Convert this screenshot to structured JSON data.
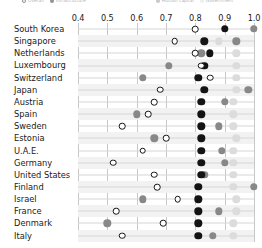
{
  "chart_data": {
    "type": "scatter",
    "title": "",
    "subtitle": "",
    "xlabel": "",
    "ylabel": "",
    "xlim": [
      0.4,
      1.0
    ],
    "xticks": [
      0.4,
      0.5,
      0.6,
      0.7,
      0.8,
      0.9,
      1.0
    ],
    "xtick_labels": [
      "0.4",
      "0.5",
      "0.6",
      "0.7",
      "0.8",
      "0.9",
      "1.0"
    ],
    "grid": true,
    "grid_axis": "x",
    "legend_position": "top",
    "orientation": "horizontal",
    "categories": [
      "South Korea",
      "Singapore",
      "Netherlands",
      "Luxembourg",
      "Switzerland",
      "Japan",
      "Austria",
      "Spain",
      "Sweden",
      "Estonia",
      "U.A.E.",
      "Germany",
      "United States",
      "Finland",
      "Israel",
      "France",
      "Denmark",
      "Italy"
    ],
    "series": [
      {
        "name": "Overall",
        "marker": "open-circle",
        "color": "#141414",
        "fill": "#ffffff",
        "values": [
          0.8,
          0.73,
          0.8,
          0.82,
          0.85,
          0.68,
          0.66,
          0.64,
          0.55,
          0.7,
          0.62,
          0.52,
          0.66,
          0.67,
          0.74,
          0.53,
          0.69,
          0.55
        ]
      },
      {
        "name": "Infrastructure",
        "marker": "filled-circle",
        "color": "#141414",
        "values": [
          0.9,
          0.83,
          0.85,
          0.83,
          0.81,
          0.83,
          0.82,
          0.82,
          0.82,
          0.82,
          0.82,
          0.82,
          0.82,
          0.81,
          0.81,
          0.81,
          0.81,
          0.81
        ]
      },
      {
        "name": "Human capital",
        "marker": "filled-circle",
        "color": "#888888",
        "values": [
          1.0,
          0.94,
          0.82,
          0.71,
          0.62,
          0.98,
          0.9,
          0.6,
          0.88,
          0.66,
          0.89,
          0.9,
          0.83,
          1.0,
          0.62,
          0.88,
          0.5,
          0.86
        ]
      },
      {
        "name": "Government",
        "marker": "filled-circle",
        "color": "#dcdcdc",
        "values": [
          1.0,
          0.88,
          0.94,
          0.94,
          0.94,
          0.94,
          0.93,
          0.93,
          0.93,
          0.94,
          0.93,
          0.93,
          0.93,
          0.93,
          0.94,
          0.94,
          0.93,
          0.93
        ]
      }
    ]
  },
  "legend": {
    "items": [
      {
        "label": "Overall",
        "color": "#ffffff"
      },
      {
        "label": "Infrastructure",
        "color": "#141414"
      },
      {
        "label": "Human capital",
        "color": "#888888"
      },
      {
        "label": "Government",
        "color": "#dcdcdc"
      }
    ]
  }
}
